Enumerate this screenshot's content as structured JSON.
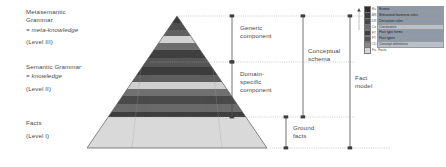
{
  "diagram": {
    "type": "layered-pyramid"
  },
  "levels": {
    "meta": {
      "name": "Metasemantic\nGrammar",
      "equals": "= meta-knowledge",
      "level": "(Level III)"
    },
    "semantic": {
      "name": "Semantic Grammar",
      "equals": "= knowledge",
      "level": "(Level II)"
    },
    "facts": {
      "name": "Facts",
      "level": "(Level I)"
    }
  },
  "annotations": {
    "generic_component": "Generic\ncomponent",
    "domain_specific_component": "Domain-\nspecific\ncomponent",
    "ground_facts": "Ground\nfacts",
    "conceptual_schema": "Conceptual\nschema",
    "fact_model": "Fact\nmodel"
  },
  "legend": {
    "rows": [
      {
        "code": "Ev",
        "label": "Events",
        "swatch": "#2e2e2e",
        "style": "fill"
      },
      {
        "code": "BR",
        "label": "Behavioral business rules",
        "swatch": "#3c3c3c",
        "style": "fill"
      },
      {
        "code": "DR",
        "label": "Derivation rules",
        "swatch": "#4a4a4a",
        "style": "fill"
      },
      {
        "code": "Co",
        "label": "Constraints",
        "swatch": "#6d6d6d",
        "style": "fill2"
      },
      {
        "code": "FT",
        "label": "Fact type forms",
        "swatch": "#3f3f3f",
        "style": "fill"
      },
      {
        "code": "FT",
        "label": "Fact types",
        "swatch": "#555555",
        "style": "fill"
      },
      {
        "code": "CD",
        "label": "Concept definitions",
        "swatch": "#8a8a8a",
        "style": "fill2"
      },
      {
        "code": "Fa",
        "label": "Facts",
        "swatch": "#d6d6d6",
        "style": "plain"
      }
    ]
  },
  "bands": {
    "description": "Horizontal strata of the pyramid from apex to base",
    "items": [
      {
        "name": "events",
        "color": "#3a3a3a"
      },
      {
        "name": "behavioral-business-rules",
        "color": "#4a4a4a"
      },
      {
        "name": "derivation-rules",
        "color": "#5c5c5c"
      },
      {
        "name": "constraints",
        "color": "#d0d0d0"
      },
      {
        "name": "generic-separator",
        "color": "#6a6a6a"
      },
      {
        "name": "fact-type-forms",
        "color": "#3d3d3d"
      },
      {
        "name": "fact-types",
        "color": "#585858"
      },
      {
        "name": "concept-definitions",
        "color": "#cfcfcf"
      },
      {
        "name": "domain-band-a",
        "color": "#4f4f4f"
      },
      {
        "name": "domain-band-b",
        "color": "#6b6b6b"
      },
      {
        "name": "ground-facts",
        "color": "#d9d9d9"
      }
    ]
  },
  "colors": {
    "stroke": "#5a5a5a",
    "text": "#4a4a4a",
    "ground_fill": "#d9d9d9",
    "background": "#ffffff"
  }
}
